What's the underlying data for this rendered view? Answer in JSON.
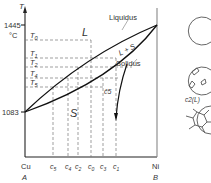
{
  "diagram": {
    "type": "binary phase diagram (isomorphous)",
    "y_axis": {
      "symbol": "T",
      "unit": "°C",
      "top_value": "1445",
      "bottom_value": "1083"
    },
    "x_axis": {
      "left": {
        "element": "Cu",
        "label": "A"
      },
      "right": {
        "element": "Ni",
        "label": "B"
      }
    },
    "regions": {
      "liquid": "L",
      "two_phase": "L + S",
      "solid": "S"
    },
    "curves": {
      "liquidus": "Liquidus",
      "solidus": "Solidus",
      "path_label": "c̄5"
    },
    "temperatures": [
      "T0",
      "T1",
      "T2",
      "T4",
      "T5"
    ],
    "temperature_subscripts": [
      "0",
      "1",
      "2",
      "4",
      "5"
    ],
    "compositions": [
      {
        "base": "c",
        "sub": "5"
      },
      {
        "base": "c",
        "sub": "4"
      },
      {
        "base": "c",
        "sub": "2"
      },
      {
        "base": "c",
        "sub": "0"
      },
      {
        "base": "c",
        "sub": "3"
      },
      {
        "base": "c",
        "sub": "1"
      }
    ],
    "microstructures": [
      {
        "name": "liquid-only",
        "label": ""
      },
      {
        "name": "dendrite-nucleation",
        "label": "c2(L)"
      },
      {
        "name": "polycrystalline-grains",
        "label": ""
      }
    ]
  }
}
